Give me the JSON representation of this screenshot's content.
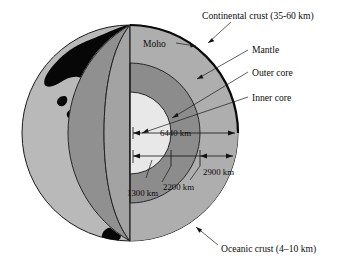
{
  "figure": {
    "background_color": "#ffffff"
  },
  "colors": {
    "crust_black": "#000000",
    "surface_light_gray": "#b9b9b9",
    "wedge_face_gray": "#8f8f8f",
    "mantle_gray": "#a8a8a8",
    "outer_core_gray": "#8a8a8a",
    "inner_core_light": "#e6e6e6",
    "outline": "#1a1a1a",
    "text": "#0d0d0d"
  },
  "labels": {
    "continental_crust": "Continental crust (35-60 km)",
    "moho": "Moho",
    "mantle": "Mantle",
    "outer_core": "Outer core",
    "inner_core": "Inner core",
    "oceanic_crust": "Oceanic crust (4–10 km)"
  },
  "dimensions": {
    "radius_total": "6440 km",
    "mantle_depth": "2900 km",
    "outer_core_radius": "2200 km",
    "inner_core_radius": "1300 km"
  },
  "layers": [
    {
      "name": "Continental crust",
      "thickness": "35-60 km"
    },
    {
      "name": "Oceanic crust",
      "thickness": "4–10 km"
    },
    {
      "name": "Mantle",
      "depth": "2900 km"
    },
    {
      "name": "Outer core",
      "radius": "2200 km"
    },
    {
      "name": "Inner core",
      "radius": "1300 km"
    },
    {
      "name": "Earth radius",
      "value": "6440 km"
    }
  ]
}
